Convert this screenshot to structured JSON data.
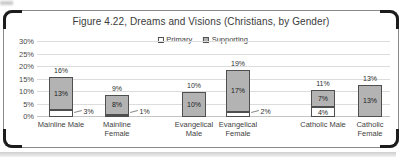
{
  "figure_title": "Figure 4.22, Dreams and Visions (Christians, by Gender)",
  "colors": {
    "primary_fill": "#ffffff",
    "supporting_fill": "#b3b3b3",
    "bar_border": "#4f4f4f",
    "gridline": "#dcdcdc",
    "text": "#3f3f3f"
  },
  "chart_data": {
    "type": "bar",
    "stacked": true,
    "title": "Figure 4.22, Dreams and Visions (Christians, by Gender)",
    "categories": [
      "Mainline Male",
      "Mainline Female",
      "Evangelical Male",
      "Evangelical Female",
      "Catholic Male",
      "Catholic Female"
    ],
    "category_label_lines": [
      [
        "Mainline Male"
      ],
      [
        "Mainline",
        "Female"
      ],
      [
        "Evangelical",
        "Male"
      ],
      [
        "Evangelical",
        "Female"
      ],
      [
        "Catholic Male"
      ],
      [
        "Catholic",
        "Female"
      ]
    ],
    "series": [
      {
        "name": "Primary",
        "color": "#ffffff",
        "values": [
          3,
          1,
          0,
          2,
          4,
          0
        ]
      },
      {
        "name": "Supporting",
        "color": "#b3b3b3",
        "values": [
          13,
          8,
          10,
          17,
          7,
          13
        ]
      }
    ],
    "totals": [
      16,
      9,
      10,
      19,
      11,
      13
    ],
    "total_labels": [
      "16%",
      "9%",
      "10%",
      "19%",
      "11%",
      "13%"
    ],
    "supporting_labels": [
      "13%",
      "8%",
      "10%",
      "17%",
      "7%",
      "13%"
    ],
    "primary_labels": [
      {
        "text": "3%",
        "placement": "callout"
      },
      {
        "text": "1%",
        "placement": "callout"
      },
      null,
      {
        "text": "2%",
        "placement": "callout"
      },
      {
        "text": "4%",
        "placement": "inside"
      },
      null
    ],
    "ylabel": "",
    "xlabel": "",
    "ylim": [
      0,
      30
    ],
    "ytick_step": 5,
    "yticks": [
      "0%",
      "5%",
      "10%",
      "15%",
      "20%",
      "25%",
      "30%"
    ],
    "grid": true,
    "legend_position": "top-center"
  }
}
